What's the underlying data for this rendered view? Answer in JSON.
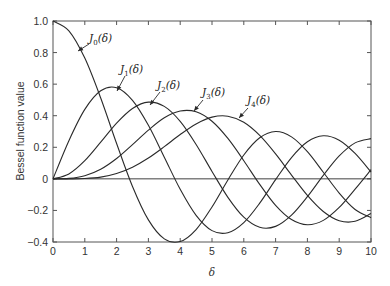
{
  "chart_data": {
    "type": "line",
    "title": "",
    "xlabel": "δ",
    "ylabel": "Bessel function value",
    "xlim": [
      0,
      10
    ],
    "ylim": [
      -0.4,
      1.0
    ],
    "xticks": [
      "0",
      "1",
      "2",
      "3",
      "4",
      "5",
      "6",
      "7",
      "8",
      "9",
      "10"
    ],
    "yticks": [
      "1.0",
      "0.8",
      "0.6",
      "0.4",
      "0.2",
      "0",
      "−0.2",
      "−0.4"
    ],
    "ytick_values": [
      1.0,
      0.8,
      0.6,
      0.4,
      0.2,
      0,
      -0.2,
      -0.4
    ],
    "grid": false,
    "legend": "none (inline annotations with arrows)",
    "x": [
      0,
      0.5,
      1,
      1.5,
      2,
      2.5,
      3,
      3.5,
      4,
      4.5,
      5,
      5.5,
      6,
      6.5,
      7,
      7.5,
      8,
      8.5,
      9,
      9.5,
      10
    ],
    "series": [
      {
        "name": "J0(δ)",
        "values": [
          1.0,
          0.938,
          0.765,
          0.512,
          0.224,
          -0.048,
          -0.26,
          -0.38,
          -0.397,
          -0.321,
          -0.178,
          -0.007,
          0.151,
          0.26,
          0.3,
          0.266,
          0.172,
          0.042,
          -0.09,
          -0.194,
          -0.246
        ]
      },
      {
        "name": "J1(δ)",
        "values": [
          0.0,
          0.242,
          0.44,
          0.558,
          0.577,
          0.497,
          0.339,
          0.137,
          -0.066,
          -0.231,
          -0.328,
          -0.341,
          -0.277,
          -0.154,
          -0.005,
          0.135,
          0.235,
          0.273,
          0.245,
          0.161,
          0.043
        ]
      },
      {
        "name": "J2(δ)",
        "values": [
          0.0,
          0.031,
          0.115,
          0.232,
          0.353,
          0.446,
          0.486,
          0.459,
          0.364,
          0.218,
          0.047,
          -0.117,
          -0.243,
          -0.307,
          -0.301,
          -0.23,
          -0.113,
          0.022,
          0.145,
          0.228,
          0.255
        ]
      },
      {
        "name": "J3(δ)",
        "values": [
          0.0,
          0.003,
          0.02,
          0.061,
          0.129,
          0.217,
          0.309,
          0.387,
          0.43,
          0.425,
          0.365,
          0.256,
          0.115,
          -0.035,
          -0.168,
          -0.258,
          -0.291,
          -0.263,
          -0.181,
          -0.065,
          0.058
        ]
      },
      {
        "name": "J4(δ)",
        "values": [
          0.0,
          0.0,
          0.002,
          0.011,
          0.034,
          0.074,
          0.132,
          0.204,
          0.281,
          0.348,
          0.391,
          0.397,
          0.358,
          0.275,
          0.158,
          0.024,
          -0.105,
          -0.207,
          -0.265,
          -0.269,
          -0.22
        ]
      }
    ],
    "annotations": [
      {
        "text": "J0(δ)",
        "base": "J",
        "sub": "0",
        "arg": "(δ)"
      },
      {
        "text": "J1(δ)",
        "base": "J",
        "sub": "1",
        "arg": "(δ)"
      },
      {
        "text": "J2(δ)",
        "base": "J",
        "sub": "2",
        "arg": "(δ)"
      },
      {
        "text": "J3(δ)",
        "base": "J",
        "sub": "3",
        "arg": "(δ)"
      },
      {
        "text": "J4(δ)",
        "base": "J",
        "sub": "4",
        "arg": "(δ)"
      }
    ],
    "zero_line": true
  },
  "colors": {
    "line": "#2a2a2a",
    "axis": "#555555",
    "text": "#333333"
  }
}
